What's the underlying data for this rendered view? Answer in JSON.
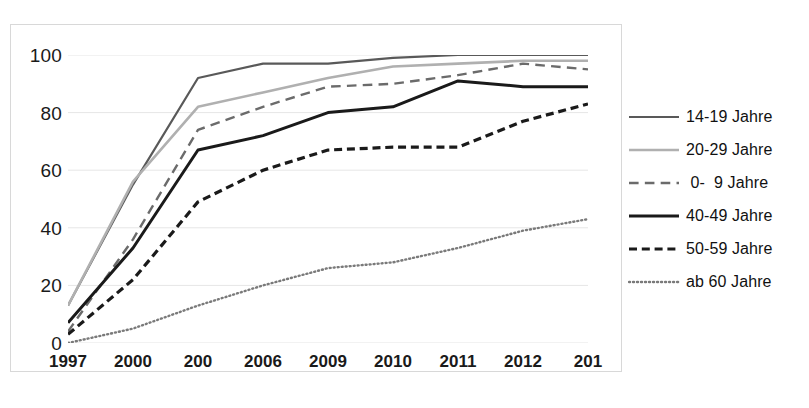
{
  "chart_data": {
    "type": "line",
    "title": "",
    "subtitle": "",
    "xlabel": "",
    "ylabel": "",
    "x": [
      "1997",
      "2000",
      "200",
      "2006",
      "2009",
      "2010",
      "2011",
      "2012",
      "201"
    ],
    "xtick_labels": [
      "1997",
      "2000",
      "200",
      "2006",
      "2009",
      "2010",
      "2011",
      "2012",
      "201"
    ],
    "ytick_labels": [
      "0",
      "20",
      "40",
      "60",
      "80",
      "100"
    ],
    "yticks": [
      0,
      20,
      40,
      60,
      80,
      100
    ],
    "ylim": [
      0,
      100
    ],
    "grid": "horizontal",
    "legend_position": "right",
    "series": [
      {
        "name": "14-19 Jahre",
        "values": [
          13,
          55,
          92,
          97,
          97,
          99,
          100,
          100,
          100
        ],
        "color": "#595959",
        "style": "solid",
        "width": 2.2
      },
      {
        "name": "20-29 Jahre",
        "values": [
          13,
          56,
          82,
          87,
          92,
          96,
          97,
          98,
          98
        ],
        "color": "#b0b0b0",
        "style": "solid",
        "width": 2.6
      },
      {
        "name": "0-  9 Jahre",
        "values": [
          4,
          36,
          74,
          82,
          89,
          90,
          93,
          97,
          95
        ],
        "color": "#6b6b6b",
        "style": "long-dash",
        "width": 2.4
      },
      {
        "name": "40-49 Jahre",
        "values": [
          7,
          33,
          67,
          72,
          80,
          82,
          91,
          89,
          89
        ],
        "color": "#1a1a1a",
        "style": "solid",
        "width": 3.0
      },
      {
        "name": "50-59 Jahre",
        "values": [
          3,
          22,
          49,
          60,
          67,
          68,
          68,
          77,
          83
        ],
        "color": "#1a1a1a",
        "style": "dash",
        "width": 3.2
      },
      {
        "name": "ab 60 Jahre",
        "values": [
          0,
          5,
          13,
          20,
          26,
          28,
          33,
          39,
          43
        ],
        "color": "#7a7a7a",
        "style": "dotted",
        "width": 2.4
      }
    ]
  },
  "legend": {
    "items": [
      {
        "label": "14-19 Jahre"
      },
      {
        "label": "20-29 Jahre"
      },
      {
        "label": " 0-  9 Jahre"
      },
      {
        "label": "40-49 Jahre"
      },
      {
        "label": "50-59 Jahre"
      },
      {
        "label": "ab 60 Jahre"
      }
    ]
  }
}
